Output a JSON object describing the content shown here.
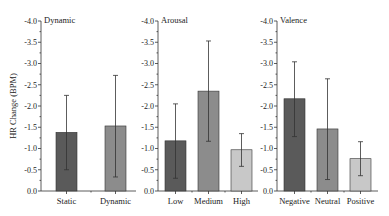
{
  "chart_data": [
    {
      "type": "bar",
      "title": "Dynamic",
      "ylabel": "HR Change (BPM)",
      "xlabel": "",
      "ylim": [
        0.0,
        -4.0
      ],
      "yticks": [
        "0.0",
        "-0.5",
        "-1.0",
        "-1.5",
        "-2.0",
        "-2.5",
        "-3.0",
        "-3.5",
        "-4.0"
      ],
      "categories": [
        "Static",
        "Dynamic"
      ],
      "values": [
        -1.38,
        -1.53
      ],
      "error_upper": [
        -2.25,
        -2.72
      ],
      "error_lower": [
        -0.5,
        -0.33
      ],
      "colors": [
        "#5a5a5a",
        "#8c8c8c"
      ],
      "grid": false
    },
    {
      "type": "bar",
      "title": "Arousal",
      "ylabel": "",
      "xlabel": "",
      "ylim": [
        0.0,
        -4.0
      ],
      "yticks": [
        "0.0",
        "-0.5",
        "-1.0",
        "-1.5",
        "-2.0",
        "-2.5",
        "-3.0",
        "-3.5",
        "-4.0"
      ],
      "categories": [
        "Low",
        "Medium",
        "High"
      ],
      "values": [
        -1.18,
        -2.35,
        -0.97
      ],
      "error_upper": [
        -2.05,
        -3.53,
        -1.35
      ],
      "error_lower": [
        -0.3,
        -1.17,
        -0.58
      ],
      "colors": [
        "#5a5a5a",
        "#8c8c8c",
        "#c8c8c8"
      ],
      "grid": false
    },
    {
      "type": "bar",
      "title": "Valence",
      "ylabel": "",
      "xlabel": "",
      "ylim": [
        0.0,
        -4.0
      ],
      "yticks": [
        "0.0",
        "-0.5",
        "-1.0",
        "-1.5",
        "-2.0",
        "-2.5",
        "-3.0",
        "-3.5",
        "-4.0"
      ],
      "categories": [
        "Negative",
        "Neutral",
        "Positive"
      ],
      "values": [
        -2.17,
        -1.46,
        -0.76
      ],
      "error_upper": [
        -3.04,
        -2.64,
        -1.16
      ],
      "error_lower": [
        -1.28,
        -0.27,
        -0.36
      ],
      "colors": [
        "#5a5a5a",
        "#8c8c8c",
        "#c8c8c8"
      ],
      "grid": false
    }
  ]
}
